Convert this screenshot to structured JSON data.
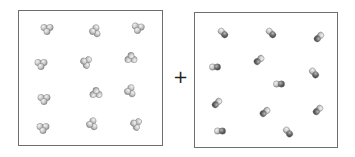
{
  "diagram": {
    "operator": "+",
    "colors": {
      "border": "#6e6e6e",
      "atom_light": "#c8c8c8",
      "atom_dark": "#6a6a6a",
      "atom_highlight": "#f2f2f2"
    },
    "left_box": {
      "label": "triatomic molecules",
      "count": 12,
      "molecules": [
        {
          "x": 47,
          "y": 29,
          "r": 0
        },
        {
          "x": 95,
          "y": 31,
          "r": 80
        },
        {
          "x": 138,
          "y": 28,
          "r": 10
        },
        {
          "x": 41,
          "y": 64,
          "r": 0
        },
        {
          "x": 86,
          "y": 62,
          "r": 110
        },
        {
          "x": 131,
          "y": 58,
          "r": 180
        },
        {
          "x": 44,
          "y": 99,
          "r": 0
        },
        {
          "x": 96,
          "y": 93,
          "r": 180
        },
        {
          "x": 130,
          "y": 91,
          "r": 80
        },
        {
          "x": 43,
          "y": 128,
          "r": 0
        },
        {
          "x": 92,
          "y": 124,
          "r": 80
        },
        {
          "x": 136,
          "y": 124,
          "r": 110
        }
      ]
    },
    "right_box": {
      "label": "diatomic molecules",
      "count": 12,
      "molecules": [
        {
          "x": 223,
          "y": 33,
          "r": 45
        },
        {
          "x": 271,
          "y": 33,
          "r": 45
        },
        {
          "x": 319,
          "y": 37,
          "r": 135
        },
        {
          "x": 215,
          "y": 67,
          "r": 0
        },
        {
          "x": 259,
          "y": 60,
          "r": 140
        },
        {
          "x": 314,
          "y": 73,
          "r": 50
        },
        {
          "x": 279,
          "y": 84,
          "r": 0
        },
        {
          "x": 217,
          "y": 103,
          "r": 135
        },
        {
          "x": 265,
          "y": 112,
          "r": 140
        },
        {
          "x": 318,
          "y": 110,
          "r": 135
        },
        {
          "x": 220,
          "y": 131,
          "r": 0
        },
        {
          "x": 288,
          "y": 132,
          "r": 50
        }
      ]
    }
  }
}
